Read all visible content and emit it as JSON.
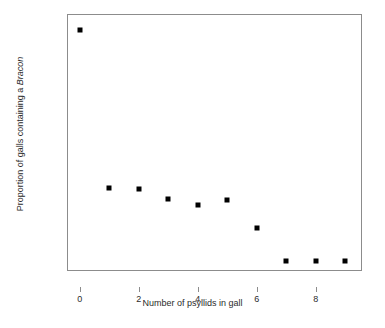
{
  "chart_data": {
    "type": "scatter",
    "title": "",
    "xlabel": "Number of psyllids in gall",
    "ylabel_parts": {
      "prefix": "Proportion of galls containing a ",
      "italic": "Bracon"
    },
    "ylabel_plain": "Proportion of galls containing a Bracon",
    "x": [
      0,
      1,
      2,
      3,
      4,
      5,
      6,
      7,
      8,
      9
    ],
    "values": [
      0.92,
      0.295,
      0.29,
      0.25,
      0.225,
      0.245,
      0.135,
      0.005,
      0.005,
      0.005
    ],
    "xlim": [
      -0.4,
      9.6
    ],
    "ylim": [
      -0.04,
      0.98
    ],
    "xticks": [
      0,
      2,
      4,
      6,
      8
    ],
    "xtick_labels": [
      "0",
      "2",
      "4",
      "6",
      "8"
    ],
    "yticks": [
      0.0,
      0.2,
      0.4,
      0.6,
      0.8
    ],
    "ytick_labels": [
      "0.0",
      "0.2",
      "0.4",
      "0.6",
      "0.8"
    ],
    "grid": false,
    "legend": null,
    "marker": "square",
    "marker_color": "#000000",
    "axis_color": "#8c8c8c",
    "background": "#ffffff"
  }
}
